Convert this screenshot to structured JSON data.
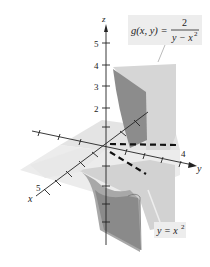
{
  "figure": {
    "type": "3d-surface-plot",
    "function_label": {
      "lhs": "g(x, y) =",
      "numerator": "2",
      "denominator": "y − x",
      "denominator_exp": "2"
    },
    "curve_label": {
      "text": "y = x",
      "exp": "2"
    },
    "axes": {
      "z": {
        "name": "z",
        "ticks": [
          "2",
          "3",
          "4",
          "5"
        ]
      },
      "y": {
        "name": "y",
        "tick_label": "4"
      },
      "x": {
        "name": "x",
        "tick_label": "5"
      }
    },
    "colors": {
      "axis": "#222222",
      "surface_dark": "#8a8a8a",
      "surface_mid": "#b5b5b5",
      "surface_light": "#dcdcdc",
      "plane": "#e6e6e6",
      "label_bg": "#ededed"
    }
  }
}
